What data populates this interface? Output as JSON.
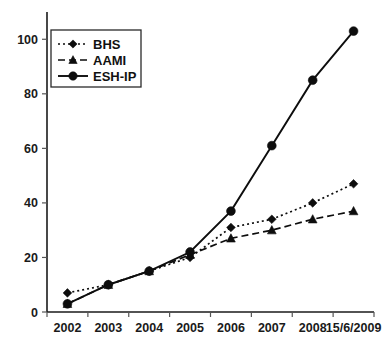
{
  "chart_data": {
    "type": "line",
    "title": "",
    "xlabel": "",
    "ylabel": "",
    "categories": [
      "2002",
      "2003",
      "2004",
      "2005",
      "2006",
      "2007",
      "2008",
      "15/6/2009"
    ],
    "series": [
      {
        "name": "BHS",
        "marker": "diamond",
        "line_style": "dotted",
        "color": "#0d0d0d",
        "values": [
          7,
          10,
          15,
          20,
          31,
          34,
          40,
          47
        ]
      },
      {
        "name": "AAMI",
        "marker": "triangle",
        "line_style": "dashed",
        "color": "#0d0d0d",
        "values": [
          3,
          10,
          15,
          21,
          27,
          30,
          34,
          37
        ]
      },
      {
        "name": "ESH-IP",
        "marker": "circle",
        "line_style": "solid",
        "color": "#0d0d0d",
        "values": [
          3,
          10,
          15,
          22,
          37,
          61,
          85,
          103
        ]
      }
    ],
    "ylim": [
      0,
      110
    ],
    "yticks": [
      0,
      20,
      40,
      60,
      80,
      100
    ],
    "ytick_labels": [
      "0",
      "20",
      "40",
      "60",
      "80",
      "100"
    ],
    "grid": false,
    "legend_position": "top-left",
    "legend_entries": [
      "BHS",
      "AAMI",
      "ESH-IP"
    ]
  }
}
